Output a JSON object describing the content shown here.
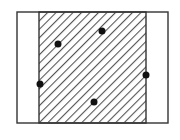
{
  "diagram": {
    "type": "hatched-region-with-points",
    "colors": {
      "background": "#ffffff",
      "outline": "#333333",
      "hatch": "#555555",
      "point": "#111111"
    },
    "outer_rect": {
      "x": 17,
      "y": 12,
      "width": 151,
      "height": 111
    },
    "hatched_rect": {
      "x": 39,
      "y": 12,
      "width": 107,
      "height": 111
    },
    "hatch": {
      "direction": "forward-slash",
      "spacing": 6,
      "stroke_width": 1.8
    },
    "points": [
      {
        "x": 58,
        "y": 44
      },
      {
        "x": 102,
        "y": 31
      },
      {
        "x": 40,
        "y": 84
      },
      {
        "x": 94,
        "y": 102
      },
      {
        "x": 146,
        "y": 75
      }
    ],
    "point_radius": 3.5
  }
}
